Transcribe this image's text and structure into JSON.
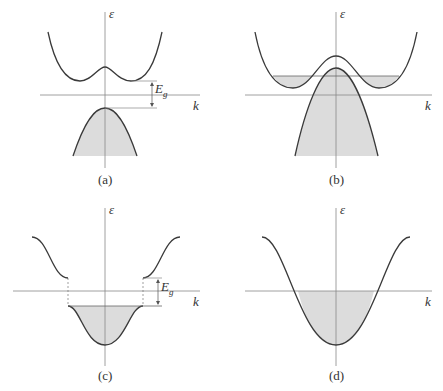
{
  "figure": {
    "colors": {
      "curve": "#3a3a3a",
      "axis": "#888888",
      "fill": "#dcdcdc",
      "text": "#333333"
    },
    "panels": [
      {
        "id": "a",
        "caption": "(a)",
        "y_axis_label": "ε",
        "x_axis_label": "k",
        "gap_label": "E",
        "gap_sub": "g",
        "description": "Semiconductor: conduction band with double minimum, filled valence band separated by gap Eg"
      },
      {
        "id": "b",
        "caption": "(b)",
        "y_axis_label": "ε",
        "x_axis_label": "k",
        "description": "Semimetal: overlapping conduction and valence bands, partially filled"
      },
      {
        "id": "c",
        "caption": "(c)",
        "y_axis_label": "ε",
        "x_axis_label": "k",
        "gap_label": "E",
        "gap_sub": "g",
        "description": "Insulator-like: filled lower band, gap Eg to upper band, dashed zone boundaries"
      },
      {
        "id": "d",
        "caption": "(d)",
        "y_axis_label": "ε",
        "x_axis_label": "k",
        "description": "Metal: single cosine band half filled"
      }
    ]
  }
}
